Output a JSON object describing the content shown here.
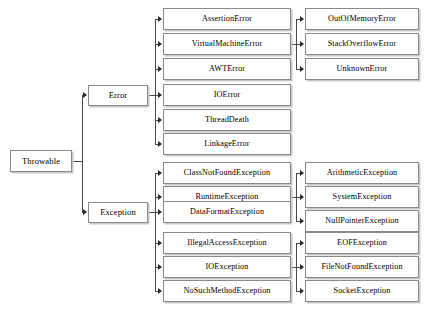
{
  "diagram": {
    "type": "tree",
    "background_color": "#ffffff",
    "box_border_color": "#8a8a8a",
    "box_fill_color": "#ffffff",
    "connector_color": "#4a4a4a",
    "text_color": "#000000"
  },
  "nodes": {
    "root": "Throwable",
    "error": "Error",
    "exception": "Exception",
    "error_children": [
      "AssertionError",
      "VirtualMachineError",
      "AWTError",
      "IOError",
      "ThreadDeath",
      "LinkageError"
    ],
    "vm_error_children": [
      "OutOfMemoryError",
      "StackOverflowError",
      "UnknownError"
    ],
    "exception_children": [
      "ClassNotFoundException",
      "RuntimeException",
      "DataFormatException",
      "IllegalAccessException",
      "IOException",
      "NoSuchMethodException"
    ],
    "runtime_exception_children": [
      "ArithmeticException",
      "SystemException",
      "NullPointerException"
    ],
    "io_exception_children": [
      "EOFException",
      "FileNotFoundException",
      "SocketException"
    ]
  }
}
